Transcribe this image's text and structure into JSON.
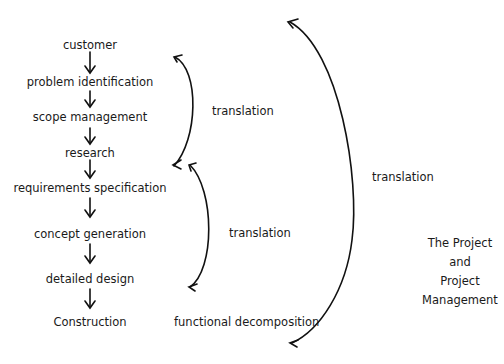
{
  "diagram": {
    "flow_steps": [
      {
        "label": "customer"
      },
      {
        "label": "problem identification"
      },
      {
        "label": "scope management"
      },
      {
        "label": "research"
      },
      {
        "label": "requirements specification"
      },
      {
        "label": "concept generation"
      },
      {
        "label": "detailed design"
      },
      {
        "label": "Construction"
      }
    ],
    "brackets": [
      {
        "label": "translation",
        "spans": "customer to research"
      },
      {
        "label": "translation",
        "spans": "research to detailed design"
      },
      {
        "label": "translation",
        "spans": "whole process"
      }
    ],
    "bottom_label": "functional decomposition",
    "side_title": {
      "line1": "The Project",
      "line2": "and",
      "line3": "Project",
      "line4": "Management"
    }
  }
}
